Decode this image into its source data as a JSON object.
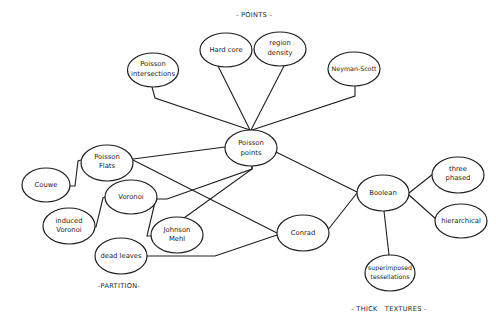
{
  "sections": {
    "points": "- POINTS -",
    "partition": "-PARTITION-",
    "thick_textures": "- THICK   TEXTURES -"
  },
  "nodes": {
    "poisson_intersections": [
      "Poisson",
      "intersections"
    ],
    "hard_core": [
      "Hard core"
    ],
    "region_density": [
      "region",
      "density"
    ],
    "neyman_scott": [
      "Neyman-Scott"
    ],
    "poisson_points": [
      "Poisson",
      "points"
    ],
    "poisson_flats": [
      "Poisson",
      "Flats"
    ],
    "couwe": [
      "Couwe"
    ],
    "voronoi": [
      "Voronoi"
    ],
    "induced_voronoi": [
      "induced",
      "Voronoi"
    ],
    "johnson_mehl": [
      "Johnson",
      "Mehl"
    ],
    "dead_leaves": [
      "dead leaves"
    ],
    "conrad": [
      "Conrad"
    ],
    "boolean": [
      "Boolean"
    ],
    "three_phased": [
      "three",
      "phased"
    ],
    "hierarchical": [
      "hierarchical"
    ],
    "superimposed_tessellations": [
      "superimposed",
      "tessellations"
    ]
  },
  "edges": [
    [
      "poisson_intersections",
      "poisson_points"
    ],
    [
      "hard_core",
      "poisson_points"
    ],
    [
      "region_density",
      "poisson_points"
    ],
    [
      "neyman_scott",
      "poisson_points"
    ],
    [
      "poisson_points",
      "poisson_flats"
    ],
    [
      "poisson_points",
      "voronoi"
    ],
    [
      "poisson_points",
      "johnson_mehl"
    ],
    [
      "poisson_points",
      "boolean"
    ],
    [
      "poisson_flats",
      "couwe"
    ],
    [
      "poisson_flats",
      "conrad"
    ],
    [
      "voronoi",
      "induced_voronoi"
    ],
    [
      "voronoi",
      "johnson_mehl"
    ],
    [
      "dead_leaves",
      "conrad"
    ],
    [
      "conrad",
      "boolean"
    ],
    [
      "boolean",
      "three_phased"
    ],
    [
      "boolean",
      "hierarchical"
    ],
    [
      "boolean",
      "superimposed_tessellations"
    ]
  ]
}
